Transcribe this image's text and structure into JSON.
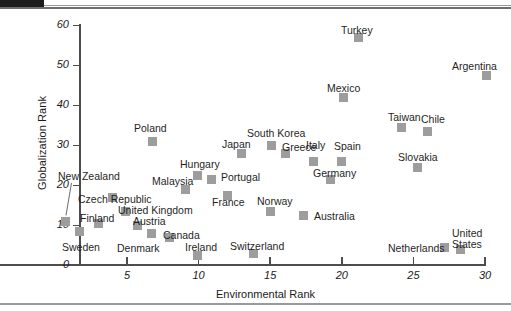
{
  "chart_data": {
    "type": "scatter",
    "title": "",
    "xlabel": "Environmental Rank",
    "ylabel": "Globalization Rank",
    "xlim": [
      0,
      30
    ],
    "ylim": [
      0,
      60
    ],
    "xticks": [
      5,
      10,
      15,
      20,
      25,
      30
    ],
    "yticks": [
      0,
      10,
      20,
      30,
      40,
      50,
      60
    ],
    "grid": false,
    "legend": "none",
    "marker_color": "#9d9d9d",
    "points": [
      {
        "label": "New Zealand",
        "x": 0.7,
        "y": 10.8,
        "lx": 58,
        "ly": 171,
        "leader": true
      },
      {
        "label": "Sweden",
        "x": 1.7,
        "y": 8.5,
        "lx": 62,
        "ly": 242
      },
      {
        "label": "Finland",
        "x": 3.0,
        "y": 10.3,
        "lx": 80,
        "ly": 213
      },
      {
        "label": "Czech Republic",
        "x": 4.0,
        "y": 16.8,
        "lx": 78,
        "ly": 194
      },
      {
        "label": "United Kingdom",
        "x": 4.9,
        "y": 13.3,
        "lx": 118,
        "ly": 205
      },
      {
        "label": "Austria",
        "x": 5.7,
        "y": 10.0,
        "lx": 133,
        "ly": 216
      },
      {
        "label": "Denmark",
        "x": 6.7,
        "y": 8.0,
        "lx": 117,
        "ly": 243
      },
      {
        "label": "Poland",
        "x": 6.8,
        "y": 31.0,
        "lx": 134,
        "ly": 123
      },
      {
        "label": "Canada",
        "x": 8.0,
        "y": 6.8,
        "lx": 163,
        "ly": 230
      },
      {
        "label": "Malaysia",
        "x": 9.1,
        "y": 18.8,
        "lx": 152,
        "ly": 176
      },
      {
        "label": "Hungary",
        "x": 9.9,
        "y": 22.5,
        "lx": 180,
        "ly": 159
      },
      {
        "label": "Ireland",
        "x": 9.9,
        "y": 2.5,
        "lx": 185,
        "ly": 242
      },
      {
        "label": "Portugal",
        "x": 10.9,
        "y": 21.3,
        "lx": 221,
        "ly": 172
      },
      {
        "label": "France",
        "x": 12.0,
        "y": 17.5,
        "lx": 212,
        "ly": 197
      },
      {
        "label": "Japan",
        "x": 13.0,
        "y": 28.0,
        "lx": 222,
        "ly": 139
      },
      {
        "label": "Switzerland",
        "x": 13.8,
        "y": 3.0,
        "lx": 230,
        "ly": 241
      },
      {
        "label": "South Korea",
        "x": 15.1,
        "y": 30.0,
        "lx": 247,
        "ly": 128
      },
      {
        "label": "Norway",
        "x": 15.0,
        "y": 13.3,
        "lx": 257,
        "ly": 196
      },
      {
        "label": "Greece",
        "x": 16.1,
        "y": 28.0,
        "lx": 282,
        "ly": 142
      },
      {
        "label": "Australia",
        "x": 17.3,
        "y": 12.5,
        "lx": 314,
        "ly": 211
      },
      {
        "label": "Italy",
        "x": 18.0,
        "y": 26.0,
        "lx": 306,
        "ly": 140
      },
      {
        "label": "Germany",
        "x": 19.2,
        "y": 21.3,
        "lx": 313,
        "ly": 168
      },
      {
        "label": "Spain",
        "x": 20.0,
        "y": 25.8,
        "lx": 334,
        "ly": 141
      },
      {
        "label": "Mexico",
        "x": 20.1,
        "y": 42.0,
        "lx": 327,
        "ly": 83
      },
      {
        "label": "Turkey",
        "x": 21.2,
        "y": 56.8,
        "lx": 341,
        "ly": 25
      },
      {
        "label": "Taiwan",
        "x": 24.2,
        "y": 34.3,
        "lx": 388,
        "ly": 112
      },
      {
        "label": "Slovakia",
        "x": 25.3,
        "y": 24.5,
        "lx": 398,
        "ly": 152
      },
      {
        "label": "Chile",
        "x": 26.0,
        "y": 33.3,
        "lx": 421,
        "ly": 114
      },
      {
        "label": "Netherlands",
        "x": 27.2,
        "y": 4.3,
        "lx": 388,
        "ly": 243
      },
      {
        "label": "United States",
        "x": 28.3,
        "y": 3.8,
        "lx": 452,
        "ly": 228,
        "two_line": true
      },
      {
        "label": "Argentina",
        "x": 30.1,
        "y": 47.3,
        "lx": 452,
        "ly": 61
      }
    ]
  },
  "axes": {
    "y_title": "Globalization Rank",
    "x_title": "Environmental Rank",
    "y_tick_labels": [
      "60",
      "50",
      "40",
      "30",
      "20",
      "10",
      "0"
    ],
    "x_tick_labels": [
      "5",
      "10",
      "15",
      "20",
      "25",
      "30"
    ]
  },
  "labels_multiline": {
    "united_states": [
      "United",
      "States"
    ]
  }
}
